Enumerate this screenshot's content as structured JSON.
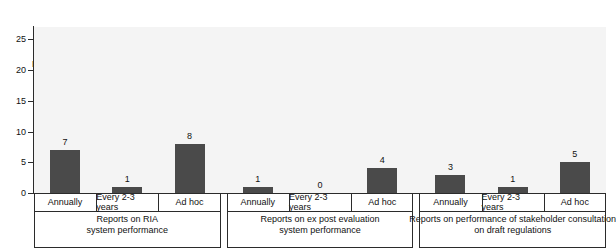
{
  "chart_data": {
    "type": "bar",
    "title": "",
    "subtitle": "",
    "xlabel": "",
    "ylabel": "Number of\nEU Member States",
    "ylabel_lines": [
      "Number of",
      "EU Member States"
    ],
    "ylim": [
      0,
      27
    ],
    "yticks": [
      0,
      5,
      10,
      15,
      20,
      25
    ],
    "ytick_labels": [
      "0",
      "5",
      "10",
      "15",
      "20",
      "25"
    ],
    "grid": false,
    "legend": null,
    "bar_color": "#4a4a4a",
    "plot_background": "#f4f4f4",
    "axis_color": "#2b2b2b",
    "categories": [
      "Annually",
      "Every 2-3 years",
      "Ad hoc"
    ],
    "groups": [
      {
        "label_lines": [
          "Reports on RIA",
          "system performance"
        ],
        "label": "Reports on RIA system performance",
        "bars": [
          {
            "category": "Annually",
            "value": 7,
            "label": "7"
          },
          {
            "category": "Every 2-3 years",
            "value": 1,
            "label": "1"
          },
          {
            "category": "Ad hoc",
            "value": 8,
            "label": "8"
          }
        ]
      },
      {
        "label_lines": [
          "Reports on ex post evaluation",
          "system performance"
        ],
        "label": "Reports on ex post evaluation system performance",
        "bars": [
          {
            "category": "Annually",
            "value": 1,
            "label": "1"
          },
          {
            "category": "Every 2-3 years",
            "value": 0,
            "label": "0"
          },
          {
            "category": "Ad hoc",
            "value": 4,
            "label": "4"
          }
        ]
      },
      {
        "label_lines": [
          "Reports on performance of stakeholder consultation",
          "on draft regulations"
        ],
        "label": "Reports on performance of stakeholder consultation on draft regulations",
        "bars": [
          {
            "category": "Annually",
            "value": 3,
            "label": "3"
          },
          {
            "category": "Every 2-3 years",
            "value": 1,
            "label": "1"
          },
          {
            "category": "Ad hoc",
            "value": 5,
            "label": "5"
          }
        ]
      }
    ],
    "series": [
      {
        "name": "Annually",
        "values": [
          7,
          1,
          3
        ]
      },
      {
        "name": "Every 2-3 years",
        "values": [
          1,
          0,
          1
        ]
      },
      {
        "name": "Ad hoc",
        "values": [
          8,
          4,
          5
        ]
      }
    ]
  }
}
